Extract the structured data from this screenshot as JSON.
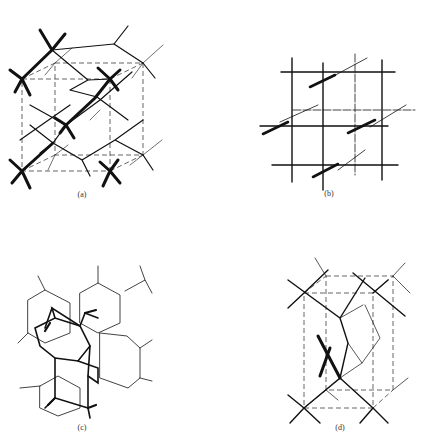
{
  "figure": {
    "panels": [
      {
        "id": "a",
        "label": "(a)",
        "description": "diamond-type tetrahedral network in cubic unit cell"
      },
      {
        "id": "b",
        "label": "(b)",
        "description": "primitive cubic framework with offset bonds"
      },
      {
        "id": "c",
        "label": "(c)",
        "description": "hexagonal puckered-layer network"
      },
      {
        "id": "d",
        "label": "(d)",
        "description": "tetrahedral network in rectangular prism unit cell"
      }
    ]
  }
}
